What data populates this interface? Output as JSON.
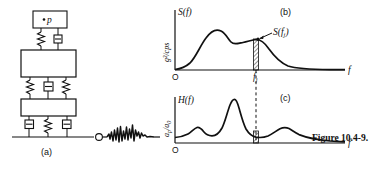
{
  "figure": {
    "caption": "Figure 10.4-9.",
    "caption_x": 312,
    "caption_y": 133
  },
  "panel_a": {
    "label": "(a)",
    "mass_point_label": "p",
    "ground_point_label": "O",
    "elements": {
      "top_mass": "instrument-mass-box",
      "middle_mass": "equipment-mass-box",
      "lower_mass": "structure-mass-box",
      "springs": "spring-element",
      "dampers": "damper-element",
      "ground": "ground-line",
      "excitation": "random-vibration-waveform"
    }
  },
  "panel_b": {
    "label": "(b)",
    "curve_name": "S(f)",
    "ylabel": "g²/cps",
    "xlabel": "f",
    "origin": "O",
    "tick_label": "f",
    "tick_sub": "j",
    "annotation": "S(f",
    "annotation_sub": "j",
    "annotation_tail": ")"
  },
  "panel_c": {
    "label": "(c)",
    "curve_name": "H(f)",
    "ylabel_num": "a",
    "ylabel_num_sub": "p",
    "ylabel_den": "a",
    "ylabel_den_sub": "0",
    "ylabel": "a_p/a_0",
    "xlabel": "f",
    "origin": "O"
  },
  "chart_data": [
    {
      "type": "line",
      "id": "panel-b-psd",
      "title": "S(f)",
      "xlabel": "f",
      "ylabel": "g²/cps",
      "xlim": [
        0,
        1
      ],
      "ylim": [
        0,
        1
      ],
      "grid": false,
      "legend": false,
      "annotations": [
        {
          "text": "S(f_j)",
          "x": 0.55,
          "y": 0.57,
          "kind": "arrow-label"
        },
        {
          "text": "f_j",
          "x": 0.55,
          "y": 0,
          "kind": "axis-tick"
        }
      ],
      "marker_points": [
        {
          "x": 0.55,
          "y": 0.55
        }
      ],
      "shaded_strip": {
        "x_start": 0.525,
        "x_end": 0.57,
        "style": "hatched"
      },
      "x": [
        0.0,
        0.04,
        0.08,
        0.12,
        0.16,
        0.2,
        0.24,
        0.28,
        0.32,
        0.36,
        0.4,
        0.44,
        0.48,
        0.52,
        0.55,
        0.58,
        0.62,
        0.66,
        0.7,
        0.74,
        0.78,
        0.82,
        0.86,
        0.9,
        0.94,
        1.0
      ],
      "y": [
        0.01,
        0.02,
        0.05,
        0.12,
        0.28,
        0.5,
        0.68,
        0.78,
        0.8,
        0.74,
        0.62,
        0.54,
        0.52,
        0.54,
        0.55,
        0.54,
        0.47,
        0.35,
        0.24,
        0.16,
        0.11,
        0.08,
        0.06,
        0.05,
        0.04,
        0.03
      ]
    },
    {
      "type": "line",
      "id": "panel-c-transfer",
      "title": "H(f)",
      "xlabel": "f",
      "ylabel": "a_p/a_0",
      "xlim": [
        0,
        1
      ],
      "ylim": [
        0,
        1
      ],
      "grid": false,
      "legend": false,
      "annotations": [
        {
          "text": "f_j dashed reference",
          "x": 0.55,
          "kind": "dashed-vline"
        }
      ],
      "shaded_strip": {
        "x_start": 0.525,
        "x_end": 0.57,
        "style": "hatched"
      },
      "peaks": [
        {
          "x": 0.19,
          "y": 0.33
        },
        {
          "x": 0.38,
          "y": 0.95
        },
        {
          "x": 0.72,
          "y": 0.3
        }
      ],
      "x": [
        0.0,
        0.05,
        0.1,
        0.14,
        0.19,
        0.24,
        0.28,
        0.32,
        0.35,
        0.38,
        0.41,
        0.44,
        0.48,
        0.52,
        0.55,
        0.6,
        0.65,
        0.7,
        0.72,
        0.76,
        0.82,
        0.88,
        0.94,
        1.0
      ],
      "y": [
        0.12,
        0.13,
        0.17,
        0.24,
        0.33,
        0.24,
        0.22,
        0.34,
        0.55,
        0.95,
        0.6,
        0.36,
        0.24,
        0.18,
        0.16,
        0.15,
        0.2,
        0.28,
        0.3,
        0.26,
        0.18,
        0.13,
        0.1,
        0.08
      ]
    }
  ]
}
